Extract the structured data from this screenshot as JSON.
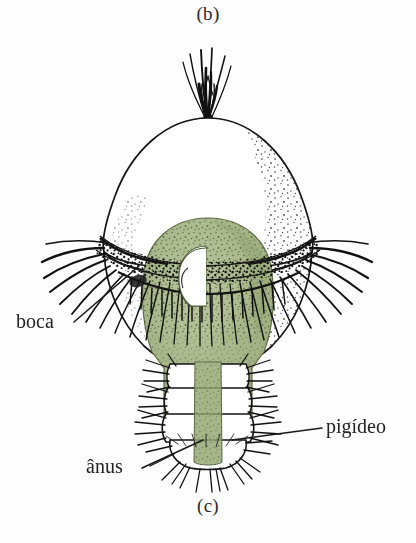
{
  "figure": {
    "panel_top_label": "(b)",
    "panel_bottom_label": "(c)",
    "background_color": "#fdfdfd",
    "ink_color": "#1a1a1a",
    "text_color": "#232323",
    "gut_fill_color": "#a3b285",
    "gut_fill_color_light": "#b3c098",
    "gut_stipple_color": "#4e5d38"
  },
  "annotations": [
    {
      "id": "boca",
      "label": "boca",
      "meaning": "mouth",
      "text_x": 16,
      "text_y": 310,
      "leader": {
        "x1": 74,
        "y1": 322,
        "x2": 139,
        "y2": 266
      }
    },
    {
      "id": "pigideo",
      "label": "pigídeo",
      "meaning": "pygidium",
      "text_x": 326,
      "text_y": 415,
      "leader": {
        "x1": 322,
        "y1": 428,
        "x2": 232,
        "y2": 440
      }
    },
    {
      "id": "anus",
      "label": "ânus",
      "meaning": "anus",
      "text_x": 86,
      "text_y": 455,
      "leader": {
        "x1": 142,
        "y1": 468,
        "x2": 203,
        "y2": 440
      }
    }
  ],
  "structures": {
    "apical_tuft": "bundle of long cilia at the apex",
    "episphere": "upper hemisphere above the prototroch",
    "prototroch": "pre-oral ciliary girdle with long cilia",
    "metatroch": "post-oral ciliary band",
    "mouth": "ventral mouth opening below the prototroch",
    "gut": "green-stained digestive tract running through the body",
    "hyposphere": "lower hemisphere below the prototroch",
    "trunk_segments": "four developing setigerous segments",
    "pygidium": "terminal segment bearing the anus",
    "telotroch": "ciliary band encircling the pygidium"
  }
}
